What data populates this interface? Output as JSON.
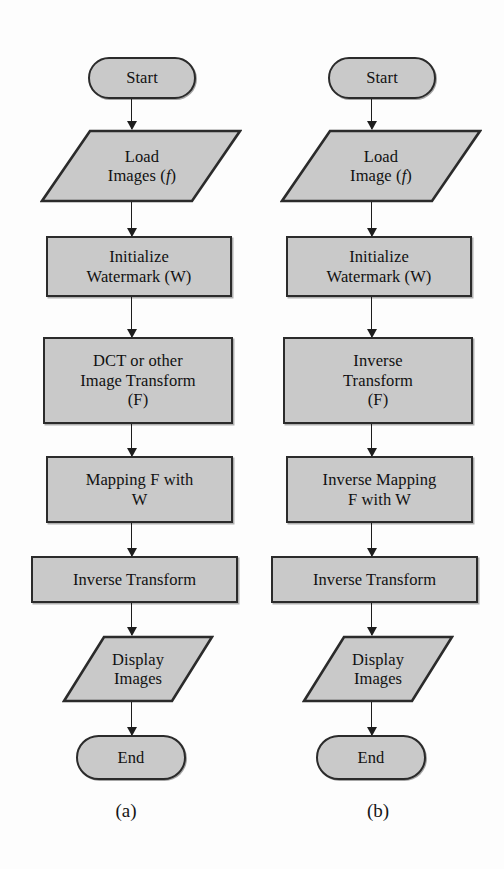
{
  "figure": {
    "type": "flowchart",
    "orientation": "two-column",
    "background": "#fdfdfd",
    "shape_fill": "#c9c9c9",
    "shape_stroke": "#2b2b2b",
    "connector_color": "#1d1d1d"
  },
  "columns": [
    {
      "id": "a",
      "caption": "(a)",
      "nodes": [
        {
          "id": "a1",
          "shape": "terminator",
          "label": "Start"
        },
        {
          "id": "a2",
          "shape": "data",
          "label": "Load\nImages (f)"
        },
        {
          "id": "a3",
          "shape": "process",
          "label": "Initialize\nWatermark (W)"
        },
        {
          "id": "a4",
          "shape": "process",
          "label": "DCT or other\nImage Transform\n(F)"
        },
        {
          "id": "a5",
          "shape": "process",
          "label": "Mapping F with\nW"
        },
        {
          "id": "a6",
          "shape": "process",
          "label": "Inverse Transform"
        },
        {
          "id": "a7",
          "shape": "data",
          "label": "Display\nImages"
        },
        {
          "id": "a8",
          "shape": "terminator",
          "label": "End"
        }
      ],
      "edges": [
        {
          "from": "a1",
          "to": "a2"
        },
        {
          "from": "a2",
          "to": "a3"
        },
        {
          "from": "a3",
          "to": "a4"
        },
        {
          "from": "a4",
          "to": "a5"
        },
        {
          "from": "a5",
          "to": "a6"
        },
        {
          "from": "a6",
          "to": "a7"
        },
        {
          "from": "a7",
          "to": "a8"
        }
      ]
    },
    {
      "id": "b",
      "caption": "(b)",
      "nodes": [
        {
          "id": "b1",
          "shape": "terminator",
          "label": "Start"
        },
        {
          "id": "b2",
          "shape": "data",
          "label": "Load\nImage (f)"
        },
        {
          "id": "b3",
          "shape": "process",
          "label": "Initialize\nWatermark (W)"
        },
        {
          "id": "b4",
          "shape": "process",
          "label": "Inverse\nTransform\n(F)"
        },
        {
          "id": "b5",
          "shape": "process",
          "label": "Inverse Mapping\nF with W"
        },
        {
          "id": "b6",
          "shape": "process",
          "label": "Inverse Transform"
        },
        {
          "id": "b7",
          "shape": "data",
          "label": "Display\nImages"
        },
        {
          "id": "b8",
          "shape": "terminator",
          "label": "End"
        }
      ],
      "edges": [
        {
          "from": "b1",
          "to": "b2"
        },
        {
          "from": "b2",
          "to": "b3"
        },
        {
          "from": "b3",
          "to": "b4"
        },
        {
          "from": "b4",
          "to": "b5"
        },
        {
          "from": "b5",
          "to": "b6"
        },
        {
          "from": "b6",
          "to": "b7"
        },
        {
          "from": "b7",
          "to": "b8"
        }
      ]
    }
  ]
}
